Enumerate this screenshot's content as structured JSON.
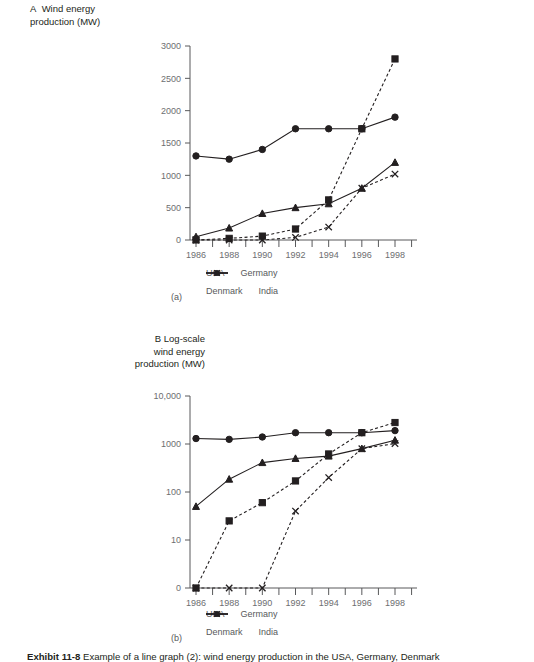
{
  "figure": {
    "caption_label": "Exhibit 11-8",
    "caption_text": "Example of a line graph (2): wind energy production in the USA, Germany, Denmark"
  },
  "panel_a": {
    "panel_letter": "A",
    "title": "Wind energy\nproduction (MW)",
    "sub_label": "(a)"
  },
  "panel_b": {
    "panel_letter": "B",
    "title": "Log-scale\nwind energy\nproduction (MW)",
    "sub_label": "(b)"
  },
  "legend": {
    "items": [
      {
        "label": "USA",
        "marker": "circle-marker-icon",
        "line": "solid"
      },
      {
        "label": "Germany",
        "marker": "square-marker-icon",
        "line": "dashed"
      },
      {
        "label": "Denmark",
        "marker": "triangle-marker-icon",
        "line": "solid"
      },
      {
        "label": "India",
        "marker": "x-marker-icon",
        "line": "dashed"
      }
    ]
  },
  "chart_data": [
    {
      "type": "line",
      "id": "chart-a-linear",
      "title": "A  Wind energy production (MW)",
      "xlabel": "",
      "ylabel": "Wind energy production (MW)",
      "x": [
        1986,
        1987,
        1988,
        1989,
        1990,
        1991,
        1992,
        1993,
        1994,
        1995,
        1996,
        1997,
        1998
      ],
      "xticks": [
        1986,
        1988,
        1990,
        1992,
        1994,
        1996,
        1998
      ],
      "yticks": [
        0,
        500,
        1000,
        1500,
        2000,
        2500,
        3000
      ],
      "ylim": [
        0,
        3000
      ],
      "xlim": [
        1985,
        1999
      ],
      "yscale": "linear",
      "grid": false,
      "legend_position": "below",
      "series": [
        {
          "name": "USA",
          "marker": "circle",
          "line": "solid",
          "x": [
            1986,
            1988,
            1990,
            1992,
            1994,
            1996,
            1998
          ],
          "values": [
            1300,
            1250,
            1400,
            1720,
            1720,
            1720,
            1900
          ]
        },
        {
          "name": "Germany",
          "marker": "square",
          "line": "dashed",
          "x": [
            1986,
            1988,
            1990,
            1992,
            1994,
            1996,
            1998
          ],
          "values": [
            1,
            25,
            60,
            170,
            620,
            1720,
            2800
          ]
        },
        {
          "name": "Denmark",
          "marker": "triangle",
          "line": "solid",
          "x": [
            1986,
            1988,
            1990,
            1992,
            1994,
            1996,
            1998
          ],
          "values": [
            50,
            185,
            410,
            500,
            560,
            800,
            1200
          ]
        },
        {
          "name": "India",
          "marker": "x",
          "line": "dashed",
          "x": [
            1986,
            1988,
            1990,
            1992,
            1994,
            1996,
            1998
          ],
          "values": [
            0,
            0,
            0,
            40,
            200,
            800,
            1020
          ]
        }
      ]
    },
    {
      "type": "line",
      "id": "chart-b-log",
      "title": "B  Log-scale wind energy production (MW)",
      "xlabel": "",
      "ylabel": "Log-scale wind energy production (MW)",
      "x": [
        1986,
        1988,
        1990,
        1992,
        1994,
        1996,
        1998
      ],
      "xticks": [
        1986,
        1988,
        1990,
        1992,
        1994,
        1996,
        1998
      ],
      "yticks": [
        "0",
        "10",
        "100",
        "1000",
        "10,000"
      ],
      "ytick_values": [
        0,
        10,
        100,
        1000,
        10000
      ],
      "ylim": [
        0,
        10000
      ],
      "xlim": [
        1985,
        1999
      ],
      "yscale": "log",
      "grid": false,
      "legend_position": "below",
      "series": [
        {
          "name": "USA",
          "marker": "circle",
          "line": "solid",
          "x": [
            1986,
            1988,
            1990,
            1992,
            1994,
            1996,
            1998
          ],
          "values": [
            1300,
            1250,
            1400,
            1720,
            1720,
            1720,
            1900
          ]
        },
        {
          "name": "Germany",
          "marker": "square",
          "line": "dashed",
          "x": [
            1986,
            1988,
            1990,
            1992,
            1994,
            1996,
            1998
          ],
          "values": [
            1,
            25,
            60,
            170,
            620,
            1720,
            2800
          ]
        },
        {
          "name": "Denmark",
          "marker": "triangle",
          "line": "solid",
          "x": [
            1986,
            1988,
            1990,
            1992,
            1994,
            1996,
            1998
          ],
          "values": [
            50,
            185,
            410,
            500,
            560,
            800,
            1200
          ]
        },
        {
          "name": "India",
          "marker": "x",
          "line": "dashed",
          "x": [
            1986,
            1988,
            1990,
            1992,
            1994,
            1996,
            1998
          ],
          "values": [
            0,
            0,
            0,
            40,
            200,
            800,
            1020
          ]
        }
      ]
    }
  ]
}
